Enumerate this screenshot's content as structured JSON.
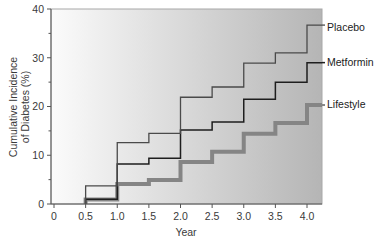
{
  "chart_data": {
    "type": "line",
    "style": "step",
    "title": "",
    "xlabel": "Year",
    "ylabel": [
      "Cumulative Incidence",
      "of Diabetes (%)"
    ],
    "xlim": [
      0,
      4.25
    ],
    "ylim": [
      0,
      40
    ],
    "x_ticks": [
      "0",
      "0.5",
      "1.0",
      "1.5",
      "2.0",
      "2.5",
      "3.0",
      "3.5",
      "4.0"
    ],
    "y_ticks": [
      "0",
      "10",
      "20",
      "30",
      "40"
    ],
    "y_minor_ticks": [
      5,
      15,
      25,
      35
    ],
    "grid": false,
    "legend_position": "right, inline labels at line ends",
    "x": [
      0.5,
      1.0,
      1.5,
      2.0,
      2.5,
      3.0,
      3.5,
      4.0
    ],
    "series": [
      {
        "name": "Placebo",
        "values": [
          3.7,
          12.6,
          14.5,
          21.9,
          24.0,
          28.9,
          31.0,
          36.7
        ],
        "color": "#4a4a4a",
        "width": 1.3
      },
      {
        "name": "Metformin",
        "values": [
          1.0,
          8.2,
          9.4,
          15.2,
          16.8,
          21.5,
          25.0,
          29.0
        ],
        "color": "#1e1e1e",
        "width": 1.5
      },
      {
        "name": "Lifestyle",
        "values": [
          0.9,
          4.1,
          4.9,
          8.6,
          10.7,
          14.4,
          16.6,
          20.3
        ],
        "color": "#858585",
        "width": 4
      }
    ],
    "background_gradient": [
      "#fbfbfb",
      "#b5b5b5"
    ]
  }
}
